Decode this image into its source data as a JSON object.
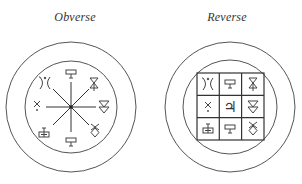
{
  "labels": {
    "obverse": "Obverse",
    "reverse": "Reverse"
  },
  "colors": {
    "ink": "#444444",
    "background": "#ffffff"
  },
  "obverse": {
    "center": [
      71,
      107
    ],
    "outer_radius": 65,
    "inner_radius": 46,
    "spoke_length": 38,
    "symbols": [
      {
        "position": "N",
        "glyph": "T-box",
        "description": "T above rectangle"
      },
      {
        "position": "NE",
        "glyph": "hourglass-up-triangle",
        "description": "hourglass with small triangle"
      },
      {
        "position": "E",
        "glyph": "double-down-triangle",
        "description": "two stacked downward triangles"
      },
      {
        "position": "SE",
        "glyph": "diamond-x",
        "description": "diamond with crossed top"
      },
      {
        "position": "S",
        "glyph": "T-box",
        "description": "T above rectangle"
      },
      {
        "position": "SW",
        "glyph": "T-patterned-box",
        "description": "T above patterned rectangle"
      },
      {
        "position": "W",
        "glyph": "x",
        "description": "small cross"
      },
      {
        "position": "NW",
        "glyph": "arc-figure",
        "description": "curved figure with dot"
      }
    ]
  },
  "reverse": {
    "center": [
      230,
      107
    ],
    "outer_radius": 65,
    "inner_radius": 47,
    "grid": {
      "x": 197,
      "y": 73,
      "size": 67,
      "rows": 3,
      "cols": 3,
      "cells": [
        [
          "arc-figure",
          "T-box",
          "hourglass-up-triangle"
        ],
        [
          "x",
          "jupiter",
          "double-down-triangle"
        ],
        [
          "T-patterned-box",
          "T-box",
          "diamond-x"
        ]
      ],
      "center_glyph_text": "♃"
    }
  }
}
